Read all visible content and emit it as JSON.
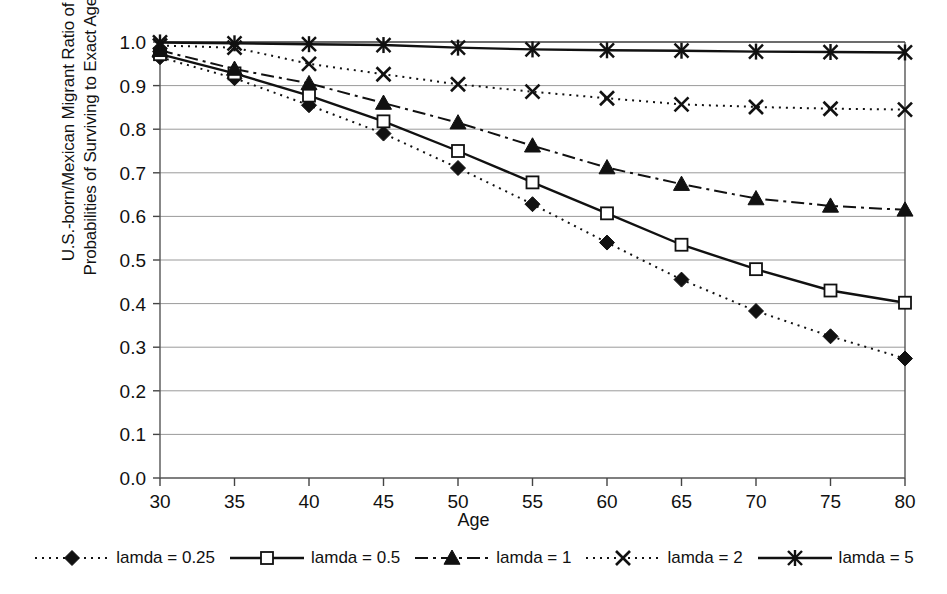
{
  "chart_data": {
    "type": "line",
    "title": "",
    "xlabel": "Age",
    "ylabel": "U.S.-born/Mexican Migrant Ratio of\nProbabilities of Surviving to Exact Ages",
    "x": [
      30,
      35,
      40,
      45,
      50,
      55,
      60,
      65,
      70,
      75,
      80
    ],
    "xlim": [
      30,
      80
    ],
    "ylim": [
      0.0,
      1.0
    ],
    "xticks": [
      "30",
      "35",
      "40",
      "45",
      "50",
      "55",
      "60",
      "65",
      "70",
      "75",
      "80"
    ],
    "yticks": [
      "0.0",
      "0.1",
      "0.2",
      "0.3",
      "0.4",
      "0.5",
      "0.6",
      "0.7",
      "0.8",
      "0.9",
      "1.0"
    ],
    "grid": "horizontal",
    "legend_position": "bottom",
    "series": [
      {
        "name": "lamda = 0.25",
        "marker": "filled-diamond",
        "linestyle": "dotted",
        "color": "#111111",
        "values": [
          0.965,
          0.917,
          0.855,
          0.79,
          0.711,
          0.628,
          0.54,
          0.455,
          0.383,
          0.325,
          0.274
        ]
      },
      {
        "name": "lamda = 0.5",
        "marker": "open-square",
        "linestyle": "solid",
        "color": "#111111",
        "values": [
          0.972,
          0.928,
          0.877,
          0.818,
          0.75,
          0.678,
          0.607,
          0.535,
          0.479,
          0.43,
          0.402
        ]
      },
      {
        "name": "lamda = 1",
        "marker": "filled-triangle",
        "linestyle": "dash-dot",
        "color": "#111111",
        "values": [
          0.981,
          0.938,
          0.905,
          0.86,
          0.815,
          0.762,
          0.712,
          0.674,
          0.641,
          0.624,
          0.615
        ]
      },
      {
        "name": "lamda = 2",
        "marker": "x",
        "linestyle": "dotted",
        "color": "#111111",
        "values": [
          0.992,
          0.987,
          0.95,
          0.926,
          0.903,
          0.886,
          0.871,
          0.857,
          0.851,
          0.847,
          0.845
        ]
      },
      {
        "name": "lamda = 5",
        "marker": "asterisk",
        "linestyle": "solid",
        "color": "#111111",
        "values": [
          0.999,
          0.997,
          0.995,
          0.993,
          0.987,
          0.983,
          0.981,
          0.98,
          0.978,
          0.977,
          0.976
        ]
      }
    ]
  },
  "axis": {
    "x_title": "Age",
    "y_title": "U.S.-born/Mexican Migrant Ratio of\nProbabilities of Surviving to Exact Ages"
  },
  "legend": {
    "items": [
      {
        "label": "lamda = 0.25"
      },
      {
        "label": "lamda = 0.5"
      },
      {
        "label": "lamda = 1"
      },
      {
        "label": "lamda = 2"
      },
      {
        "label": "lamda = 5"
      }
    ]
  }
}
